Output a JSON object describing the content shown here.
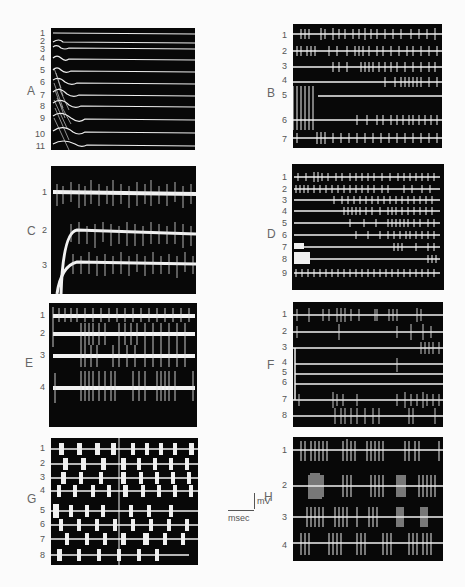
{
  "figure": {
    "panels": [
      {
        "id": "A",
        "label": "A",
        "trace_labels": [
          "1",
          "2",
          "3",
          "4",
          "5",
          "6",
          "7",
          "8",
          "9",
          "10",
          "11"
        ],
        "trace_count": 11
      },
      {
        "id": "B",
        "label": "B",
        "trace_labels": [
          "1",
          "2",
          "3",
          "4",
          "5",
          "6",
          "7"
        ],
        "trace_count": 7
      },
      {
        "id": "C",
        "label": "C",
        "trace_labels": [
          "1",
          "2",
          "3"
        ],
        "trace_count": 3
      },
      {
        "id": "D",
        "label": "D",
        "trace_labels": [
          "1",
          "2",
          "3",
          "4",
          "5",
          "6",
          "7",
          "8",
          "9"
        ],
        "trace_count": 9
      },
      {
        "id": "E",
        "label": "E",
        "trace_labels": [
          "1",
          "2",
          "3",
          "4"
        ],
        "trace_count": 4
      },
      {
        "id": "F",
        "label": "F",
        "trace_labels": [
          "1",
          "2",
          "3",
          "4",
          "5",
          "6",
          "7",
          "8"
        ],
        "trace_count": 8
      },
      {
        "id": "G",
        "label": "G",
        "trace_labels": [
          "1",
          "2",
          "3",
          "4",
          "5",
          "6",
          "7",
          "8"
        ],
        "trace_count": 8
      },
      {
        "id": "H",
        "label": "H",
        "trace_labels": [
          "1",
          "2",
          "3",
          "4"
        ],
        "trace_count": 4
      }
    ],
    "scale_bar": {
      "vertical_unit": "mV",
      "horizontal_unit": "msec"
    },
    "colors": {
      "background": "#fbfbfb",
      "panel": "#080808",
      "trace": "#f2f2f2",
      "label": "#666666"
    }
  }
}
